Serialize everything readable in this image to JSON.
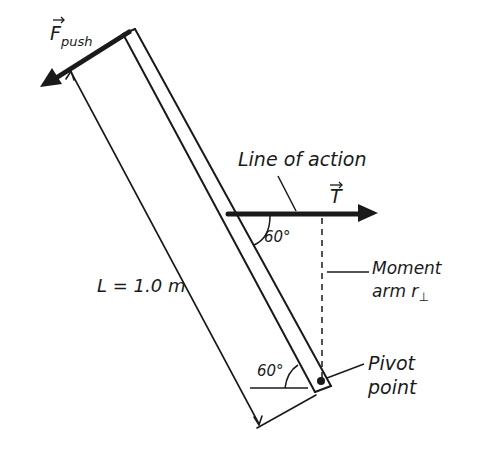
{
  "diagram": {
    "type": "torque-lever-diagram",
    "colors": {
      "ink": "#1a1a1a",
      "background": "#ffffff"
    },
    "labels": {
      "force_push": "F",
      "force_push_sub": "push",
      "tension": "T",
      "line_of_action": "Line of action",
      "angle_top": "60°",
      "angle_bottom": "60°",
      "length": "L = 1.0 m",
      "moment_arm_line1": "Moment",
      "moment_arm_line2": "arm r",
      "moment_arm_sub": "⊥",
      "pivot_line1": "Pivot",
      "pivot_line2": "point"
    }
  }
}
